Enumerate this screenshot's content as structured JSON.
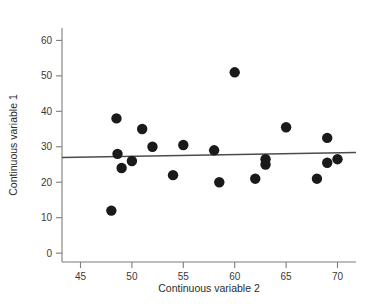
{
  "chart_data": {
    "type": "scatter",
    "title": "",
    "xlabel": "Continuous variable 2",
    "ylabel": "Continuous variable 1",
    "xlim": [
      43.2,
      71.8
    ],
    "ylim": [
      -2.5,
      63.5
    ],
    "xticks": [
      45,
      50,
      55,
      60,
      65,
      70
    ],
    "xticklabels": [
      "45",
      "50",
      "55",
      "60",
      "65",
      "70"
    ],
    "yticks": [
      0,
      10,
      20,
      30,
      40,
      50,
      60
    ],
    "yticklabels": [
      "0",
      "10",
      "20",
      "30",
      "40",
      "50",
      "60"
    ],
    "grid": false,
    "legend": null,
    "marker_color": "#1a1a1a",
    "marker_size": 5.2,
    "points": [
      {
        "x": 48.0,
        "y": 12.0
      },
      {
        "x": 48.5,
        "y": 38.0
      },
      {
        "x": 48.6,
        "y": 28.0
      },
      {
        "x": 49.0,
        "y": 24.0
      },
      {
        "x": 50.0,
        "y": 26.0
      },
      {
        "x": 51.0,
        "y": 35.0
      },
      {
        "x": 52.0,
        "y": 30.0
      },
      {
        "x": 54.0,
        "y": 22.0
      },
      {
        "x": 55.0,
        "y": 30.5
      },
      {
        "x": 58.0,
        "y": 29.0
      },
      {
        "x": 58.5,
        "y": 20.0
      },
      {
        "x": 60.0,
        "y": 51.0
      },
      {
        "x": 62.0,
        "y": 21.0
      },
      {
        "x": 63.0,
        "y": 25.0
      },
      {
        "x": 63.0,
        "y": 26.5
      },
      {
        "x": 65.0,
        "y": 35.5
      },
      {
        "x": 68.0,
        "y": 21.0
      },
      {
        "x": 69.0,
        "y": 25.5
      },
      {
        "x": 69.0,
        "y": 32.5
      },
      {
        "x": 70.0,
        "y": 26.5
      }
    ],
    "trend_line": {
      "color": "#4c4c4c",
      "x_start": 43.2,
      "y_start": 27.0,
      "x_end": 71.8,
      "y_end": 28.4
    }
  },
  "axes": {
    "x_title": "Continuous variable 2",
    "y_title": "Continuous variable 1"
  },
  "x_tick_labels": [
    "45",
    "50",
    "55",
    "60",
    "65",
    "70"
  ],
  "y_tick_labels": [
    "0",
    "10",
    "20",
    "30",
    "40",
    "50",
    "60"
  ]
}
